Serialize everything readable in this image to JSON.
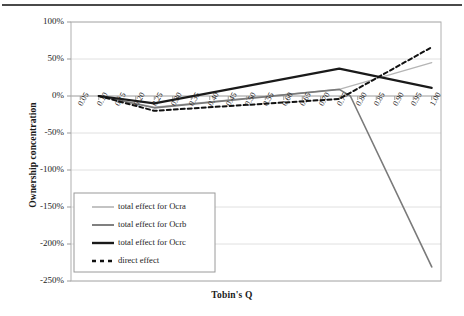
{
  "chart_data": {
    "type": "line",
    "title": "",
    "xlabel": "Tobin's Q",
    "ylabel": "Ownership concentration",
    "xlim": [
      0.025,
      1.025
    ],
    "ylim": [
      -250,
      100
    ],
    "yticks": [
      100,
      50,
      0,
      -50,
      -100,
      -150,
      -200,
      -250
    ],
    "ytick_labels": [
      "100%",
      "50%",
      "0%",
      "-50%",
      "-100%",
      "-150%",
      "-200%",
      "-250%"
    ],
    "grid": true,
    "grid_axis": "y",
    "legend_position": "lower-left-inside",
    "x": [
      0.05,
      0.1,
      0.15,
      0.2,
      0.25,
      0.3,
      0.35,
      0.4,
      0.45,
      0.5,
      0.55,
      0.6,
      0.65,
      0.7,
      0.75,
      0.8,
      0.85,
      0.9,
      0.95,
      1.0
    ],
    "xtick_labels": [
      "0.05",
      "0.10",
      "0.15",
      "0.20",
      "0.25",
      "0.30",
      "0.35",
      "0.40",
      "0.45",
      "0.50",
      "0.55",
      "0.60",
      "0.65",
      "0.70",
      "0.75",
      "0.80",
      "0.85",
      "0.90",
      "0.95",
      "1.00"
    ],
    "series": [
      {
        "name": "total effect for Ocra",
        "color": "#b5b5b5",
        "width": 1.3,
        "dash": "none",
        "x": [
          0.1,
          0.25,
          0.75,
          1.0
        ],
        "values": [
          0,
          -15,
          9,
          45
        ]
      },
      {
        "name": "total effect for Ocrb",
        "color": "#7a7a7a",
        "width": 1.6,
        "dash": "none",
        "x": [
          0.1,
          0.25,
          0.75,
          0.78,
          1.0
        ],
        "values": [
          0,
          -16,
          9,
          0,
          -231
        ]
      },
      {
        "name": "total effect for Ocrc",
        "color": "#1a1a1a",
        "width": 2.1,
        "dash": "none",
        "x": [
          0.1,
          0.25,
          0.75,
          1.0
        ],
        "values": [
          0,
          -10,
          37,
          11
        ]
      },
      {
        "name": "direct effect",
        "color": "#111111",
        "width": 2.0,
        "dash": "dotted",
        "x": [
          0.1,
          0.25,
          0.75,
          1.0
        ],
        "values": [
          0,
          -20,
          -4,
          66
        ]
      }
    ]
  },
  "legend": {
    "items": [
      {
        "label": "total effect for Ocra"
      },
      {
        "label": "total effect for Ocrb"
      },
      {
        "label": "total effect for Ocrc"
      },
      {
        "label": "direct effect"
      }
    ]
  },
  "colors": {
    "grid": "#dcdcdc",
    "axis": "#9a9a9a",
    "plot_border": "#b0b0b0",
    "top_rule": "#4a4a4a",
    "text": "#1a1a1a"
  }
}
